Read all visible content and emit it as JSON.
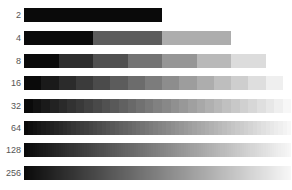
{
  "chart_data": {
    "type": "bar",
    "title": "",
    "categories": [
      "2",
      "4",
      "8",
      "16",
      "32",
      "64",
      "128",
      "256"
    ],
    "levels": [
      2,
      4,
      8,
      16,
      32,
      64,
      128,
      256
    ],
    "ramp_start_color": "#0a0a0a",
    "ramp_end_color": "#ffffff",
    "bar_x_start_px": 24,
    "full_ramp_width_px": 276,
    "xlabel": "",
    "ylabel": "",
    "grid": false,
    "legend": null
  },
  "rows": [
    {
      "label": "2",
      "levels": 2,
      "top": 8
    },
    {
      "label": "4",
      "levels": 4,
      "top": 31
    },
    {
      "label": "8",
      "levels": 8,
      "top": 54
    },
    {
      "label": "16",
      "levels": 16,
      "top": 76
    },
    {
      "label": "32",
      "levels": 32,
      "top": 99
    },
    {
      "label": "64",
      "levels": 64,
      "top": 121
    },
    {
      "label": "128",
      "levels": 128,
      "top": 143
    },
    {
      "label": "256",
      "levels": 256,
      "top": 166
    }
  ]
}
